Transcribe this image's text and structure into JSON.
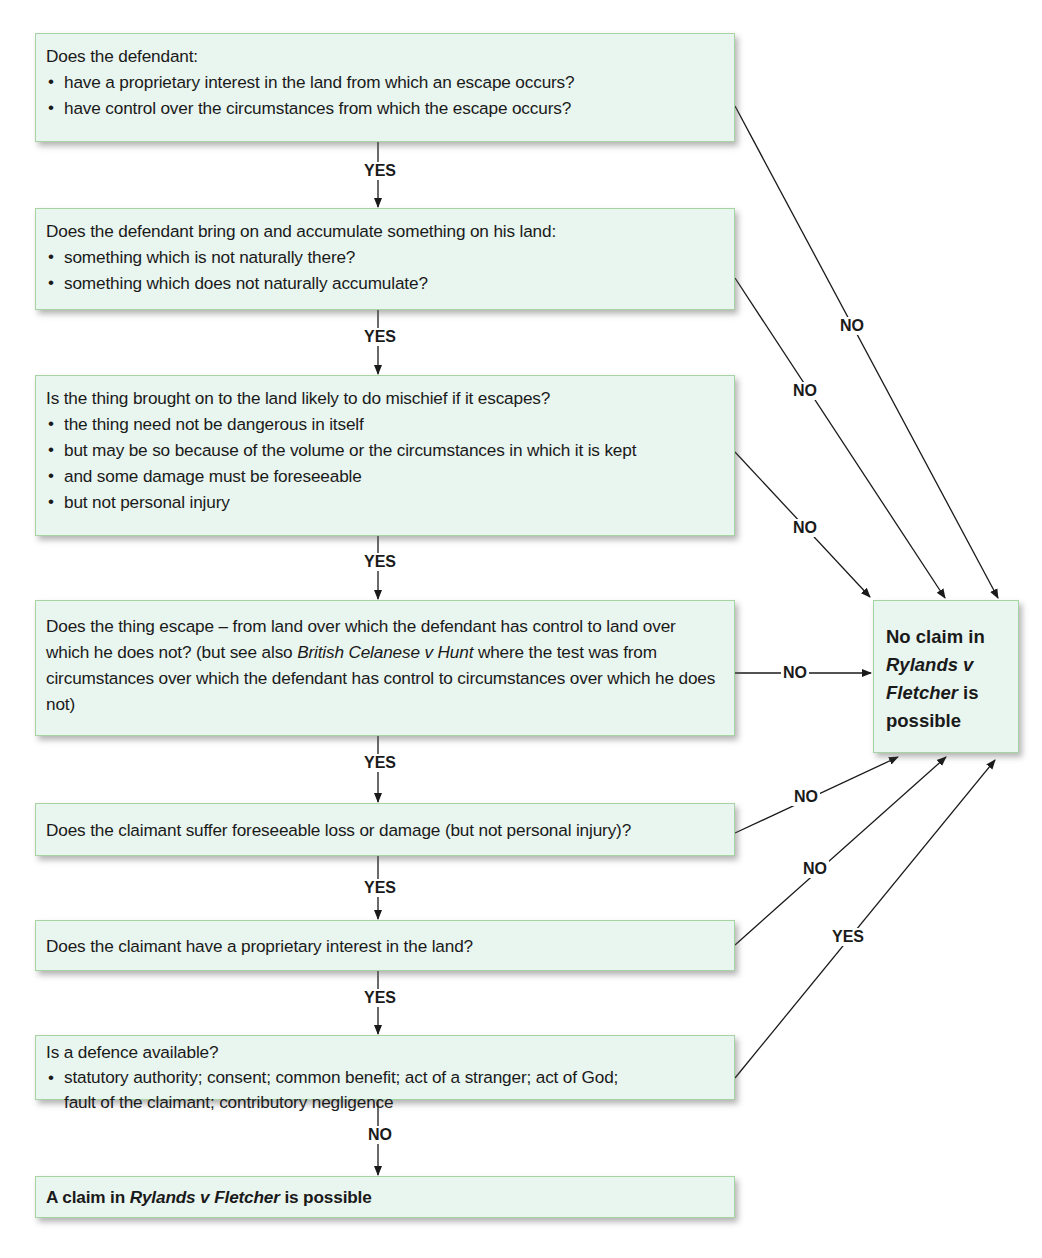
{
  "diagram": {
    "questions": [
      {
        "id": "q1",
        "text": "Does the defendant:",
        "bullets": [
          "have a proprietary interest in the land from which an escape occurs?",
          "have control over the circumstances from which the escape occurs?"
        ],
        "down_label": "YES",
        "side_label": "NO"
      },
      {
        "id": "q2",
        "text": "Does the defendant bring on and accumulate something on his land:",
        "bullets": [
          "something which is not naturally there?",
          "something which does not naturally accumulate?"
        ],
        "down_label": "YES",
        "side_label": "NO"
      },
      {
        "id": "q3",
        "text": "Is the thing brought on to the land likely to do mischief if it escapes?",
        "bullets": [
          "the thing need not be dangerous in itself",
          "but may be so because of the volume or the circumstances in which it is kept",
          "and some damage must be foreseeable",
          "but not personal injury"
        ],
        "down_label": "YES",
        "side_label": "NO"
      },
      {
        "id": "q4",
        "text_part1": "Does the thing escape – from land over which the defendant has control to land over which he does not? (but see also ",
        "text_italic": "British Celanese v Hunt",
        "text_part2": " where the test was from circumstances over which the defendant has control to circumstances over which he does not)",
        "down_label": "YES",
        "side_label": "NO"
      },
      {
        "id": "q5",
        "text": "Does the claimant suffer foreseeable loss or damage (but not personal injury)?",
        "down_label": "YES",
        "side_label": "NO"
      },
      {
        "id": "q6",
        "text": "Does the claimant have a proprietary interest in the land?",
        "down_label": "YES",
        "side_label": "NO"
      },
      {
        "id": "q7",
        "text": "Is a defence available?",
        "bullet_line1": "statutory authority; consent; common benefit; act of a stranger; act of God;",
        "bullet_line2": "fault of the claimant; contributory negligence",
        "down_label": "NO",
        "side_label": "YES"
      }
    ],
    "outcome_positive": {
      "part1": "A claim in ",
      "italic": "Rylands v Fletcher",
      "part2": " is possible"
    },
    "outcome_negative": {
      "line1": "No claim in",
      "italic1": "Rylands v",
      "italic2": "Fletcher",
      "tail": " is",
      "line4": "possible"
    },
    "colors": {
      "box_fill": "#e9f5ef",
      "box_border": "#a7d2a2",
      "arrow": "#1a1a1a",
      "background": "#ffffff"
    }
  }
}
